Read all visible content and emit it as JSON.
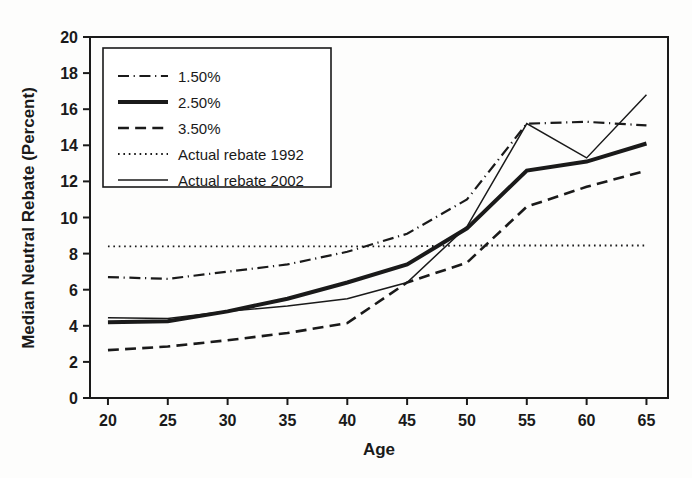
{
  "chart_data": {
    "type": "line",
    "title": "",
    "xlabel": "Age",
    "ylabel": "Median Neutral Rebate (Percent)",
    "x": [
      20,
      25,
      30,
      35,
      40,
      45,
      50,
      55,
      60,
      65
    ],
    "xtick_labels": [
      "20",
      "25",
      "30",
      "35",
      "40",
      "45",
      "50",
      "55",
      "60",
      "65"
    ],
    "ytick_labels": [
      "0",
      "2",
      "4",
      "6",
      "8",
      "10",
      "12",
      "14",
      "16",
      "18",
      "20"
    ],
    "yticks": [
      0,
      2,
      4,
      6,
      8,
      10,
      12,
      14,
      16,
      18,
      20
    ],
    "xlim": [
      18.5,
      66.8
    ],
    "ylim": [
      0,
      20
    ],
    "grid": false,
    "legend_position": "upper-left-inside",
    "series": [
      {
        "name": "1.50%",
        "style": "dash-dot",
        "width": 2.2,
        "color": "#1a1a1a",
        "values": [
          6.7,
          6.6,
          7.0,
          7.4,
          8.1,
          9.1,
          11.0,
          15.2,
          15.3,
          15.1
        ]
      },
      {
        "name": "2.50%",
        "style": "solid-thick",
        "width": 4.0,
        "color": "#1a1a1a",
        "values": [
          4.2,
          4.25,
          4.8,
          5.5,
          6.4,
          7.4,
          9.4,
          12.6,
          13.1,
          14.1
        ]
      },
      {
        "name": "3.50%",
        "style": "dashed",
        "width": 2.6,
        "color": "#1a1a1a",
        "values": [
          2.65,
          2.85,
          3.2,
          3.6,
          4.15,
          6.4,
          7.5,
          10.6,
          11.7,
          12.6
        ]
      },
      {
        "name": "Actual rebate 1992",
        "style": "dotted",
        "width": 1.8,
        "color": "#1a1a1a",
        "values": [
          8.4,
          8.4,
          8.4,
          8.4,
          8.4,
          8.4,
          8.45,
          8.45,
          8.45,
          8.45
        ]
      },
      {
        "name": "Actual rebate 2002",
        "style": "solid-thin",
        "width": 1.5,
        "color": "#1a1a1a",
        "values": [
          4.45,
          4.4,
          4.8,
          5.1,
          5.5,
          6.4,
          9.5,
          15.2,
          13.3,
          16.8
        ]
      }
    ],
    "legend_entries": [
      {
        "label": "1.50%",
        "style": "dash-dot"
      },
      {
        "label": "2.50%",
        "style": "solid-thick"
      },
      {
        "label": "3.50%",
        "style": "dashed"
      },
      {
        "label": "Actual rebate 1992",
        "style": "dotted"
      },
      {
        "label": "Actual rebate 2002",
        "style": "solid-thin"
      }
    ]
  }
}
